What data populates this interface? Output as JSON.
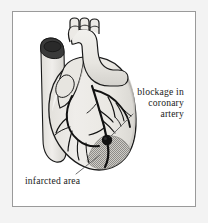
{
  "figure": {
    "type": "anatomical-illustration",
    "background_color": "#f3f3f3",
    "frame_color": "#9a9a9a",
    "canvas_color": "#ffffff"
  },
  "labels": {
    "blockage": {
      "line1": "blockage in",
      "line2": "coronary",
      "line3": "artery"
    },
    "infarcted": {
      "text": "infarcted area"
    }
  },
  "annotations": {
    "blockage_marker_color": "#111111",
    "infarct_fill_color": "#b9b9b9",
    "leader_line_color": "#5a5a5a",
    "vessel_color": "#111111",
    "myocardium_fill": "#eceae6",
    "myocardium_shade": "#d6d4cf"
  }
}
